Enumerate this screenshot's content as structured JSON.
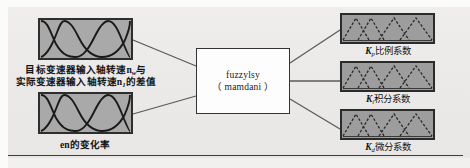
{
  "figure": {
    "type": "fuzzy-control-block-diagram",
    "background_color": "#edebe9",
    "block_fill_color": "#a9a9a9",
    "block_border_color": "#2e2e2e",
    "engine_fill_color": "#fdfdfd",
    "connector_color": "#5a5a5a"
  },
  "inputs": [
    {
      "id": "input-error",
      "membership_style": "gaussian",
      "membership_count": 3,
      "caption_line1": "目标变速器输入轴转速n",
      "caption_line1_sub": "w",
      "caption_line1_tail": "与",
      "caption_line2": "实际变速器输入轴转速n",
      "caption_line2_sub": "1",
      "caption_line2_tail": "的差值"
    },
    {
      "id": "input-error-rate",
      "membership_style": "gaussian",
      "membership_count": 3,
      "caption": "en的变化率"
    }
  ],
  "engine": {
    "id": "fuzzy-inference-engine",
    "line1": "fuzzylsy",
    "line2": "（ mamdani ）"
  },
  "outputs": [
    {
      "id": "output-kp",
      "membership_style": "triangular-dashed",
      "membership_count": 4,
      "symbol": "K",
      "subscript": "p",
      "caption": "比例系数"
    },
    {
      "id": "output-ki",
      "membership_style": "triangular-dashed",
      "membership_count": 4,
      "symbol": "K",
      "subscript": "i",
      "caption": "积分系数"
    },
    {
      "id": "output-kd",
      "membership_style": "triangular-dashed",
      "membership_count": 4,
      "symbol": "K",
      "subscript": "d",
      "caption": "微分系数"
    }
  ]
}
